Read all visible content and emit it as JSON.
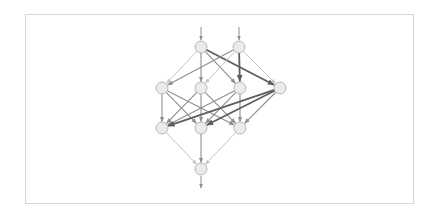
{
  "diagram": {
    "type": "layered-network-graph",
    "colors": {
      "background": "#ffffff",
      "frame_border": "#d6d6d6",
      "node_fill": "#ebebeb",
      "node_stroke": "#a8a8a8",
      "edge_light": "#c4c4c4",
      "edge_medium": "#8e8e8e",
      "edge_dark": "#5e5e5e"
    },
    "node_radius": 6,
    "layers": [
      {
        "name": "input",
        "nodes": [
          {
            "id": "a1",
            "x": 201,
            "y": 47
          },
          {
            "id": "a2",
            "x": 239,
            "y": 47
          }
        ]
      },
      {
        "name": "hidden-1",
        "nodes": [
          {
            "id": "b1",
            "x": 162,
            "y": 88
          },
          {
            "id": "b2",
            "x": 201,
            "y": 88
          },
          {
            "id": "b3",
            "x": 240,
            "y": 88
          },
          {
            "id": "b4",
            "x": 280,
            "y": 88
          }
        ]
      },
      {
        "name": "hidden-2",
        "nodes": [
          {
            "id": "c1",
            "x": 162,
            "y": 128
          },
          {
            "id": "c2",
            "x": 201,
            "y": 128
          },
          {
            "id": "c3",
            "x": 240,
            "y": 128
          }
        ]
      },
      {
        "name": "output",
        "nodes": [
          {
            "id": "d1",
            "x": 201,
            "y": 169
          }
        ]
      }
    ],
    "input_arrows": [
      {
        "x": 201,
        "y1": 27,
        "y2": 40
      },
      {
        "x": 239,
        "y1": 27,
        "y2": 40
      }
    ],
    "output_arrows": [
      {
        "x": 201,
        "y1": 176,
        "y2": 188
      }
    ],
    "edges": [
      {
        "from": "a1",
        "to": "b1",
        "weight": "light"
      },
      {
        "from": "a1",
        "to": "b2",
        "weight": "medium"
      },
      {
        "from": "a1",
        "to": "b3",
        "weight": "medium"
      },
      {
        "from": "a1",
        "to": "b4",
        "weight": "dark"
      },
      {
        "from": "a2",
        "to": "b1",
        "weight": "medium"
      },
      {
        "from": "a2",
        "to": "b2",
        "weight": "light"
      },
      {
        "from": "a2",
        "to": "b3",
        "weight": "dark"
      },
      {
        "from": "a2",
        "to": "b4",
        "weight": "light"
      },
      {
        "from": "b1",
        "to": "c1",
        "weight": "medium"
      },
      {
        "from": "b1",
        "to": "c2",
        "weight": "medium"
      },
      {
        "from": "b1",
        "to": "c3",
        "weight": "medium"
      },
      {
        "from": "b2",
        "to": "c1",
        "weight": "medium"
      },
      {
        "from": "b2",
        "to": "c2",
        "weight": "medium"
      },
      {
        "from": "b2",
        "to": "c3",
        "weight": "medium"
      },
      {
        "from": "b3",
        "to": "c1",
        "weight": "medium"
      },
      {
        "from": "b3",
        "to": "c2",
        "weight": "medium"
      },
      {
        "from": "b3",
        "to": "c3",
        "weight": "medium"
      },
      {
        "from": "b4",
        "to": "c1",
        "weight": "dark"
      },
      {
        "from": "b4",
        "to": "c2",
        "weight": "dark"
      },
      {
        "from": "b4",
        "to": "c3",
        "weight": "medium"
      },
      {
        "from": "c1",
        "to": "d1",
        "weight": "light"
      },
      {
        "from": "c2",
        "to": "d1",
        "weight": "medium"
      },
      {
        "from": "c3",
        "to": "d1",
        "weight": "light"
      }
    ]
  }
}
